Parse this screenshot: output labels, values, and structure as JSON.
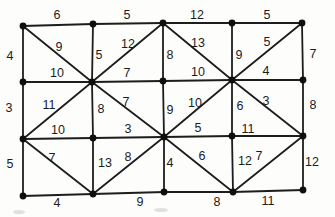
{
  "figure": {
    "background": "#fdfdfc",
    "line_color": "#1d1d1d",
    "node_color": "#0f0f0f",
    "label_color": "#1c1c1c",
    "nodes": [
      {
        "id": "r1c1",
        "x": 23,
        "y": 26
      },
      {
        "id": "r1c2",
        "x": 93,
        "y": 24
      },
      {
        "id": "r1c3",
        "x": 163,
        "y": 23
      },
      {
        "id": "r1c4",
        "x": 232,
        "y": 23
      },
      {
        "id": "r1c5",
        "x": 302,
        "y": 23
      },
      {
        "id": "r2c1",
        "x": 23,
        "y": 82
      },
      {
        "id": "r2c2",
        "x": 92,
        "y": 82
      },
      {
        "id": "r2c3",
        "x": 163,
        "y": 81
      },
      {
        "id": "r2c4",
        "x": 232,
        "y": 80
      },
      {
        "id": "r2c5",
        "x": 303,
        "y": 80
      },
      {
        "id": "r3c1",
        "x": 23,
        "y": 139
      },
      {
        "id": "r3c2",
        "x": 93,
        "y": 138
      },
      {
        "id": "r3c3",
        "x": 164,
        "y": 137
      },
      {
        "id": "r3c4",
        "x": 232,
        "y": 136
      },
      {
        "id": "r3c5",
        "x": 303,
        "y": 136
      },
      {
        "id": "r4c1",
        "x": 23,
        "y": 196
      },
      {
        "id": "r4c2",
        "x": 93,
        "y": 194
      },
      {
        "id": "r4c3",
        "x": 164,
        "y": 192
      },
      {
        "id": "r4c4",
        "x": 233,
        "y": 192
      },
      {
        "id": "r4c5",
        "x": 303,
        "y": 190
      }
    ],
    "edges": [
      {
        "from": "r1c1",
        "to": "r1c2",
        "w": 6,
        "lx": 57,
        "ly": 15
      },
      {
        "from": "r1c2",
        "to": "r1c3",
        "w": 5,
        "lx": 127,
        "ly": 15
      },
      {
        "from": "r1c3",
        "to": "r1c4",
        "w": 12,
        "lx": 197,
        "ly": 15
      },
      {
        "from": "r1c4",
        "to": "r1c5",
        "w": 5,
        "lx": 267,
        "ly": 15
      },
      {
        "from": "r2c1",
        "to": "r2c2",
        "w": 10,
        "lx": 57,
        "ly": 73
      },
      {
        "from": "r2c2",
        "to": "r2c3",
        "w": 7,
        "lx": 127,
        "ly": 73
      },
      {
        "from": "r2c3",
        "to": "r2c4",
        "w": 10,
        "lx": 198,
        "ly": 72
      },
      {
        "from": "r2c4",
        "to": "r2c5",
        "w": 4,
        "lx": 266,
        "ly": 71
      },
      {
        "from": "r3c1",
        "to": "r3c2",
        "w": 10,
        "lx": 58,
        "ly": 130
      },
      {
        "from": "r3c2",
        "to": "r3c3",
        "w": 3,
        "lx": 128,
        "ly": 129
      },
      {
        "from": "r3c3",
        "to": "r3c4",
        "w": 5,
        "lx": 198,
        "ly": 128
      },
      {
        "from": "r3c4",
        "to": "r3c5",
        "w": 11,
        "lx": 248,
        "ly": 129
      },
      {
        "from": "r4c1",
        "to": "r4c2",
        "w": 4,
        "lx": 57,
        "ly": 203
      },
      {
        "from": "r4c2",
        "to": "r4c3",
        "w": 9,
        "lx": 140,
        "ly": 202
      },
      {
        "from": "r4c3",
        "to": "r4c4",
        "w": 8,
        "lx": 217,
        "ly": 202
      },
      {
        "from": "r4c4",
        "to": "r4c5",
        "w": 11,
        "lx": 268,
        "ly": 201
      },
      {
        "from": "r1c1",
        "to": "r2c1",
        "w": 4,
        "lx": 10,
        "ly": 56
      },
      {
        "from": "r2c1",
        "to": "r3c1",
        "w": 3,
        "lx": 9,
        "ly": 108
      },
      {
        "from": "r3c1",
        "to": "r4c1",
        "w": 5,
        "lx": 10,
        "ly": 164
      },
      {
        "from": "r1c2",
        "to": "r2c2",
        "w": 5,
        "lx": 99,
        "ly": 55
      },
      {
        "from": "r2c2",
        "to": "r3c2",
        "w": 8,
        "lx": 101,
        "ly": 109
      },
      {
        "from": "r3c2",
        "to": "r4c2",
        "w": 13,
        "lx": 105,
        "ly": 163
      },
      {
        "from": "r1c3",
        "to": "r2c3",
        "w": 8,
        "lx": 170,
        "ly": 55
      },
      {
        "from": "r2c3",
        "to": "r3c3",
        "w": 9,
        "lx": 170,
        "ly": 110
      },
      {
        "from": "r3c3",
        "to": "r4c3",
        "w": 4,
        "lx": 170,
        "ly": 163
      },
      {
        "from": "r1c4",
        "to": "r2c4",
        "w": 9,
        "lx": 239,
        "ly": 55
      },
      {
        "from": "r2c4",
        "to": "r3c4",
        "w": 6,
        "lx": 240,
        "ly": 106
      },
      {
        "from": "r3c4",
        "to": "r4c4",
        "w": 12,
        "lx": 245,
        "ly": 161
      },
      {
        "from": "r1c5",
        "to": "r2c5",
        "w": 7,
        "lx": 313,
        "ly": 54
      },
      {
        "from": "r2c5",
        "to": "r3c5",
        "w": 8,
        "lx": 313,
        "ly": 105
      },
      {
        "from": "r3c5",
        "to": "r4c5",
        "w": 12,
        "lx": 312,
        "ly": 162
      },
      {
        "from": "r1c1",
        "to": "r2c2",
        "w": 9,
        "lx": 59,
        "ly": 47
      },
      {
        "from": "r1c3",
        "to": "r2c2",
        "w": 12,
        "lx": 128,
        "ly": 44
      },
      {
        "from": "r1c3",
        "to": "r2c4",
        "w": 13,
        "lx": 198,
        "ly": 43
      },
      {
        "from": "r1c5",
        "to": "r2c4",
        "w": 5,
        "lx": 267,
        "ly": 42
      },
      {
        "from": "r2c2",
        "to": "r3c1",
        "w": 11,
        "lx": 49,
        "ly": 105
      },
      {
        "from": "r2c2",
        "to": "r3c3",
        "w": 7,
        "lx": 126,
        "ly": 102
      },
      {
        "from": "r2c4",
        "to": "r3c3",
        "w": 10,
        "lx": 195,
        "ly": 103
      },
      {
        "from": "r2c4",
        "to": "r3c5",
        "w": 3,
        "lx": 266,
        "ly": 101
      },
      {
        "from": "r3c1",
        "to": "r4c2",
        "w": 7,
        "lx": 52,
        "ly": 158
      },
      {
        "from": "r4c2",
        "to": "r3c3",
        "w": 8,
        "lx": 128,
        "ly": 157
      },
      {
        "from": "r3c3",
        "to": "r4c4",
        "w": 6,
        "lx": 202,
        "ly": 156
      },
      {
        "from": "r4c4",
        "to": "r3c5",
        "w": 7,
        "lx": 259,
        "ly": 156
      }
    ],
    "smudges": [
      {
        "x": 19,
        "y": 212,
        "rx": 6,
        "ry": 2
      },
      {
        "x": 161,
        "y": 210,
        "rx": 7,
        "ry": 2
      }
    ]
  }
}
